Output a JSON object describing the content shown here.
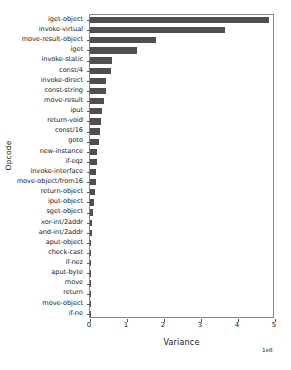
{
  "chart_data": {
    "type": "bar",
    "orientation": "horizontal",
    "title": "",
    "xlabel": "Variance",
    "ylabel": "Opcode",
    "x_offset_text": "1e8",
    "x_tick_labels": [
      "0",
      "1",
      "2",
      "3",
      "4",
      "5"
    ],
    "x_tick_values": [
      0,
      1,
      2,
      3,
      4,
      5
    ],
    "xlim": [
      0,
      5
    ],
    "grid": false,
    "legend": null,
    "bar_color": "#4f4f4f",
    "units": "1e8",
    "categories": [
      "iget-object",
      "invoke-virtual",
      "move-result-object",
      "iget",
      "invoke-static",
      "const/4",
      "invoke-direct",
      "const-string",
      "move-result",
      "iput",
      "return-void",
      "const/16",
      "goto",
      "new-instance",
      "if-eqz",
      "invoke-interface",
      "move-object/from16",
      "return-object",
      "iput-object",
      "sget-object",
      "xor-int/2addr",
      "and-int/2addr",
      "aput-object",
      "check-cast",
      "if-nez",
      "aput-byte",
      "move",
      "return",
      "move-object",
      "if-ne"
    ],
    "values": [
      4.85,
      3.65,
      1.78,
      1.28,
      0.6,
      0.58,
      0.44,
      0.42,
      0.38,
      0.33,
      0.29,
      0.27,
      0.25,
      0.19,
      0.18,
      0.17,
      0.16,
      0.14,
      0.1,
      0.08,
      0.05,
      0.045,
      0.035,
      0.03,
      0.028,
      0.022,
      0.018,
      0.015,
      0.012,
      0.01
    ]
  }
}
